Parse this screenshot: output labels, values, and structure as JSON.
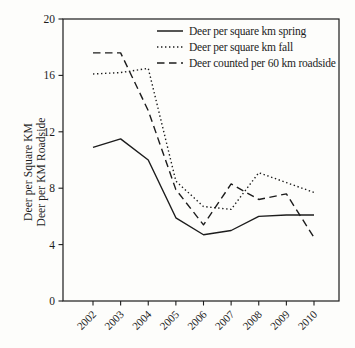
{
  "figure": {
    "background": "#fdfdfb",
    "line_color": "#1c1c1c",
    "axis_color": "#1c1c1c"
  },
  "chart_data": {
    "type": "line",
    "title": "",
    "xlabel": "",
    "ylabel_line1": "Deer per Square KM",
    "ylabel_line2": "Deer per KM Roadside",
    "x": [
      2002,
      2003,
      2004,
      2005,
      2006,
      2007,
      2008,
      2009,
      2010
    ],
    "ylim": [
      0,
      20
    ],
    "yticks": [
      0,
      4,
      8,
      12,
      16,
      20
    ],
    "grid": false,
    "frame": "full-box",
    "legend_position": "top-right-inside",
    "series": [
      {
        "name": "Deer per square km spring",
        "style": "solid",
        "values": [
          10.9,
          11.5,
          10.0,
          5.9,
          4.7,
          5.0,
          6.0,
          6.1,
          6.1
        ]
      },
      {
        "name": "Deer per square km fall",
        "style": "dotted",
        "values": [
          16.1,
          16.2,
          16.5,
          8.5,
          6.7,
          6.5,
          9.1,
          8.4,
          7.7
        ]
      },
      {
        "name": "Deer counted per 60 km roadside",
        "style": "dashed",
        "values": [
          17.6,
          17.6,
          13.5,
          7.9,
          5.4,
          8.3,
          7.2,
          7.6,
          4.5
        ]
      }
    ]
  }
}
